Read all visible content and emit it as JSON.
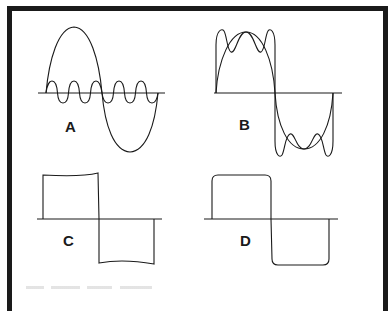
{
  "figure": {
    "panels": [
      {
        "id": "A",
        "label": "A",
        "description": "Fundamental sine wave with third-harmonic-like ripple wave superimposed"
      },
      {
        "id": "B",
        "label": "B",
        "description": "Sine wave with summed harmonics showing overshoot horns"
      },
      {
        "id": "C",
        "label": "C",
        "description": "Square wave with slightly sagging tops"
      },
      {
        "id": "D",
        "label": "D",
        "description": "Square wave with rounded corners"
      }
    ],
    "colors": {
      "stroke": "#1a1a1a",
      "background": "#ffffff",
      "border": "#1a1a1a"
    }
  }
}
